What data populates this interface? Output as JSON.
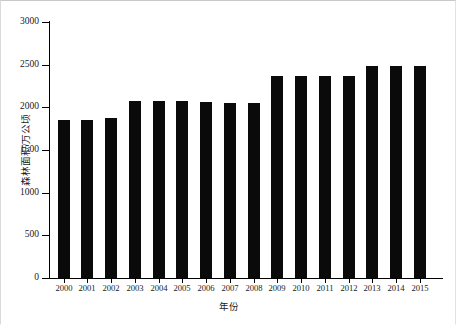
{
  "chart_data": {
    "type": "bar",
    "title": "",
    "xlabel": "年份",
    "ylabel": "森林面积/万公顷",
    "categories": [
      "2000",
      "2001",
      "2002",
      "2003",
      "2004",
      "2005",
      "2006",
      "2007",
      "2008",
      "2009",
      "2010",
      "2011",
      "2012",
      "2013",
      "2014",
      "2015"
    ],
    "values": [
      1850,
      1855,
      1880,
      2070,
      2070,
      2070,
      2065,
      2050,
      2050,
      2370,
      2370,
      2370,
      2370,
      2490,
      2490,
      2490
    ],
    "ylim": [
      0,
      3000
    ],
    "yticks": [
      0,
      500,
      1000,
      1500,
      2000,
      2500,
      3000
    ],
    "ytick_labels": [
      "0",
      "500",
      "1000",
      "1500",
      "2000",
      "2500",
      "3000"
    ],
    "grid": false,
    "legend": null,
    "bar_color": "#0a0a0a",
    "axis_color": "#000000",
    "background_color": "#ffffff"
  }
}
